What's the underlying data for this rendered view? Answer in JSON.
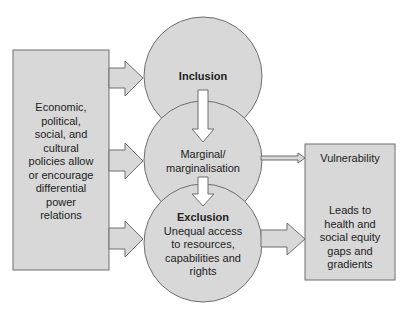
{
  "colors": {
    "fill": "#d8d8d8",
    "stroke": "#6e6e6e",
    "text": "#222222",
    "background": "#ffffff"
  },
  "left_box": {
    "lines": [
      "Economic,",
      "political,",
      "social, and",
      "cultural",
      "policies allow",
      "or encourage",
      "differential",
      "power",
      "relations"
    ]
  },
  "circles": {
    "inclusion": {
      "title": "Inclusion"
    },
    "marginal": {
      "lines": [
        "Marginal/",
        "marginalisation"
      ]
    },
    "exclusion": {
      "title": "Exclusion",
      "lines": [
        "Unequal access",
        "to resources,",
        "capabilities and",
        "rights"
      ]
    }
  },
  "right_box": {
    "top_label": "Vulnerability",
    "bottom_lines": [
      "Leads to",
      "health and",
      "social equity",
      "gaps and",
      "gradients"
    ]
  },
  "arrows": [
    {
      "from": "left_box",
      "to": "inclusion"
    },
    {
      "from": "left_box",
      "to": "marginal"
    },
    {
      "from": "left_box",
      "to": "exclusion"
    },
    {
      "from": "inclusion",
      "to": "marginal"
    },
    {
      "from": "marginal",
      "to": "exclusion"
    },
    {
      "from": "marginal",
      "to": "vulnerability"
    },
    {
      "from": "exclusion",
      "to": "right_box"
    }
  ]
}
